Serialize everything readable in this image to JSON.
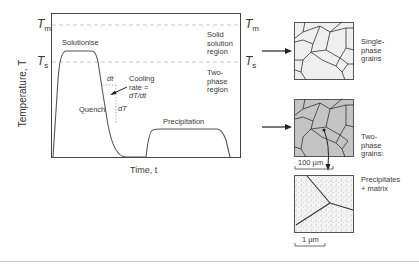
{
  "diagram": {
    "axes": {
      "y_label": "Temperature, T",
      "x_label": "Time, t"
    },
    "temperature_levels": {
      "melting": {
        "symbol": "T",
        "subscript": "m"
      },
      "solvus": {
        "symbol": "T",
        "subscript": "s"
      }
    },
    "regions": {
      "solid_solution": [
        "Solid",
        "solution",
        "region"
      ],
      "two_phase": [
        "Two-",
        "phase",
        "region"
      ]
    },
    "stages": {
      "solutionise": "Solutionise",
      "quench": "Quench",
      "precipitation": "Precipitation"
    },
    "annotations": {
      "dt": "dt",
      "dT": "dT",
      "cooling_rate": [
        "Cooling",
        "rate =",
        "dT/dt"
      ]
    },
    "micrographs": [
      {
        "id": "single-phase",
        "caption": [
          "Single-",
          "phase",
          "grains"
        ],
        "fill": "#efefef"
      },
      {
        "id": "two-phase",
        "caption": [
          "Two-",
          "phase",
          "grains:"
        ],
        "fill": "#c4c4c4",
        "scale_bar": "100 µm"
      },
      {
        "id": "precipitates",
        "caption": [
          "Precipitates",
          "+ matrix"
        ],
        "fill": "#f4f4f4",
        "scale_bar": "1 µm"
      }
    ],
    "colors": {
      "curve": "#555555",
      "dashed": "#bbbbbb",
      "frame": "#444444",
      "grain_boundary": "#333333"
    }
  }
}
